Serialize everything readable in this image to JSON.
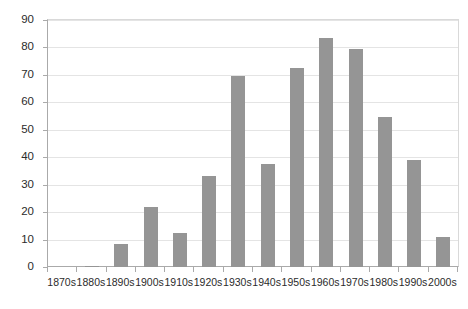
{
  "chart_data": {
    "type": "bar",
    "title": "",
    "subtitle": "",
    "xlabel": "",
    "ylabel": "",
    "categories": [
      "1870s",
      "1880s",
      "1890s",
      "1900s",
      "1910s",
      "1920s",
      "1930s",
      "1940s",
      "1950s",
      "1960s",
      "1970s",
      "1980s",
      "1990s",
      "2000s"
    ],
    "values": [
      0,
      0.5,
      8.5,
      22,
      12.5,
      33,
      69.5,
      37.5,
      72.5,
      83.5,
      79.5,
      54.5,
      39,
      11
    ],
    "ylim": [
      0,
      90
    ],
    "ytick_values": [
      0,
      10,
      20,
      30,
      40,
      50,
      60,
      70,
      80,
      90
    ],
    "ytick_labels": [
      "0",
      "10",
      "20",
      "30",
      "40",
      "50",
      "60",
      "70",
      "80",
      "90"
    ],
    "grid": true,
    "grid_axis": "y",
    "legend": false,
    "legend_position": "none",
    "bar_color": "#959595",
    "grid_color": "#e4e4e4",
    "axis_color": "#aaaaaa",
    "background_color": "#ffffff",
    "annotations": []
  }
}
